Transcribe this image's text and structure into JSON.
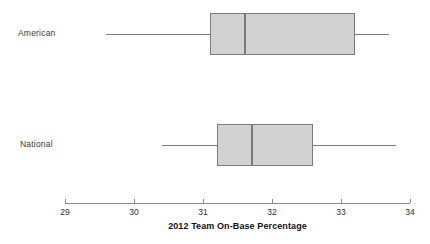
{
  "chart_data": {
    "type": "box",
    "title": "",
    "xlabel": "2012 Team On-Base Percentage",
    "ylabel": "",
    "orientation": "horizontal",
    "xlim": [
      29,
      34
    ],
    "xticks": [
      29,
      30,
      31,
      32,
      33,
      34
    ],
    "xticklabels": [
      "29",
      "30",
      "31",
      "32",
      "33",
      "34"
    ],
    "grid": false,
    "legend": false,
    "categories": [
      "American",
      "National"
    ],
    "boxes": [
      {
        "label": "American",
        "min": 29.6,
        "q1": 31.1,
        "median": 31.6,
        "q3": 33.2,
        "max": 33.7,
        "fill": "#d2d2d2",
        "stroke": "#7b7b7b"
      },
      {
        "label": "National",
        "min": 30.4,
        "q1": 31.2,
        "median": 31.7,
        "q3": 32.6,
        "max": 33.8,
        "fill": "#d2d2d2",
        "stroke": "#7b7b7b"
      }
    ]
  },
  "axis": {
    "title": "2012 Team On-Base Percentage",
    "tick_labels": [
      "29",
      "30",
      "31",
      "32",
      "33",
      "34"
    ]
  },
  "labels": {
    "american": "American",
    "national": "National"
  },
  "colors": {
    "box_fill": "#d2d2d2",
    "box_stroke": "#7b7b7b",
    "axis": "#8a8a8a",
    "text": "#2e2e2e",
    "background": "#ffffff"
  }
}
